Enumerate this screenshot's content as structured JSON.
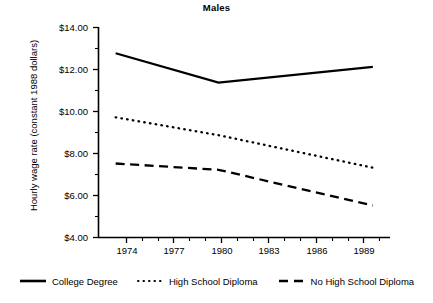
{
  "chart_data": {
    "type": "line",
    "title": "Males",
    "xlabel": "",
    "ylabel": "Hourly wage rate (constant 1988 dollars)",
    "x": [
      1974,
      1980,
      1989
    ],
    "xlim": [
      1973,
      1990
    ],
    "ylim": [
      4.0,
      14.0
    ],
    "grid": false,
    "legend_position": "bottom",
    "x_tick_labels": [
      "1974",
      "1977",
      "1980",
      "1983",
      "1986",
      "1989"
    ],
    "x_tick_values": [
      1974,
      1977,
      1980,
      1983,
      1986,
      1989
    ],
    "x_minor_ticks": [
      1975,
      1976,
      1978,
      1979,
      1981,
      1982,
      1984,
      1985,
      1987,
      1988
    ],
    "y_tick_labels": [
      "$14.00",
      "$12.00",
      "$10.00",
      "$8.00",
      "$6.00",
      "$4.00"
    ],
    "y_tick_values": [
      14.0,
      12.0,
      10.0,
      8.0,
      6.0,
      4.0
    ],
    "y_minor_ticks": [
      13.0,
      11.0,
      9.0,
      7.0,
      5.0
    ],
    "series": [
      {
        "name": "College Degree",
        "style": "solid",
        "color": "#000000",
        "values": [
          12.75,
          11.35,
          12.1
        ]
      },
      {
        "name": "High School Diploma",
        "style": "dotted",
        "color": "#000000",
        "values": [
          9.7,
          8.85,
          7.3
        ]
      },
      {
        "name": "No High School Diploma",
        "style": "dashed",
        "color": "#000000",
        "values": [
          7.5,
          7.2,
          5.5
        ]
      }
    ]
  },
  "legend": {
    "items": [
      {
        "label": "College Degree",
        "style": "solid"
      },
      {
        "label": "High School Diploma",
        "style": "dotted"
      },
      {
        "label": "No High School Diploma",
        "style": "dashed"
      }
    ]
  },
  "axis": {
    "y_labels": [
      "$14.00",
      "$12.00",
      "$10.00",
      "$8.00",
      "$6.00",
      "$4.00"
    ],
    "x_labels": [
      "1974",
      "1977",
      "1980",
      "1983",
      "1986",
      "1989"
    ]
  }
}
